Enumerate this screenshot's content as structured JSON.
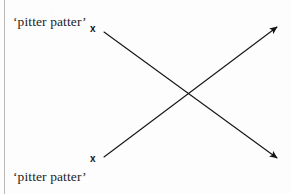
{
  "figure": {
    "background_color": "#fdfdfd",
    "ink_color": "#141414",
    "width": 291,
    "height": 194,
    "margin_rule": {
      "name": "left-margin-rule",
      "color": "#b9b9b9",
      "x": 4
    }
  },
  "captions": [
    {
      "id": "top",
      "text": "‘pitter patter’",
      "x": 13,
      "y": 15
    },
    {
      "id": "bottom",
      "text": "‘pitter patter’",
      "x": 13,
      "y": 170
    }
  ],
  "markers": [
    {
      "id": "top",
      "label": "x",
      "x": 95,
      "y": 28
    },
    {
      "id": "bottom",
      "label": "x",
      "x": 95,
      "y": 158
    }
  ],
  "arrows": [
    {
      "id": "down-right",
      "description": "arrow from upper-left x marker to lower-right",
      "from_x": 104,
      "from_y": 32,
      "to_x": 281,
      "to_y": 162,
      "stroke": "#141414",
      "stroke_width": 1.1
    },
    {
      "id": "up-right",
      "description": "arrow from lower-left x marker to upper-right",
      "from_x": 104,
      "from_y": 157,
      "to_x": 281,
      "to_y": 23,
      "stroke": "#141414",
      "stroke_width": 1.1
    }
  ],
  "crossing_point": {
    "x": 189,
    "y": 97
  }
}
